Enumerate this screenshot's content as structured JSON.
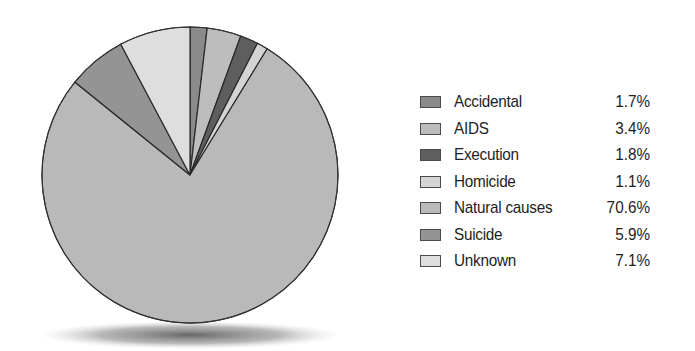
{
  "chart_data": {
    "type": "pie",
    "title": "",
    "categories": [
      "Accidental",
      "AIDS",
      "Execution",
      "Homicide",
      "Natural causes",
      "Suicide",
      "Unknown"
    ],
    "values": [
      1.7,
      3.4,
      1.8,
      1.1,
      70.6,
      5.9,
      7.1
    ],
    "value_labels": [
      "1.7%",
      "3.4%",
      "1.8%",
      "1.1%",
      "70.6%",
      "5.9%",
      "7.1%"
    ],
    "colors": [
      "#8a8a8a",
      "#bdbdbd",
      "#5e5e5e",
      "#d4d4d4",
      "#b9b9b9",
      "#949494",
      "#dedede"
    ],
    "start_angle_deg": 0,
    "direction": "clockwise",
    "legend_position": "right",
    "values_sum": 91.6,
    "note": "Labeled percentages sum to 91.6%, not 100%, yet the pie is drawn as a full circle. Slice angles are rendered proportionally to the labeled values (normalized by their sum) so the circle closes. The labeled values are reproduced as printed."
  },
  "legend": {
    "items": [
      {
        "label": "Accidental",
        "value": "1.7%"
      },
      {
        "label": "AIDS",
        "value": "3.4%"
      },
      {
        "label": "Execution",
        "value": "1.8%"
      },
      {
        "label": "Homicide",
        "value": "1.1%"
      },
      {
        "label": "Natural causes",
        "value": "70.6%"
      },
      {
        "label": "Suicide",
        "value": "5.9%"
      },
      {
        "label": "Unknown",
        "value": "7.1%"
      }
    ]
  }
}
